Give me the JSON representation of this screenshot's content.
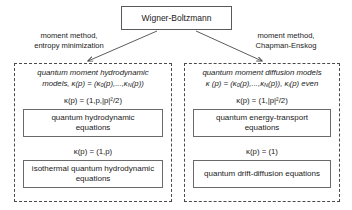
{
  "root": {
    "label": "Wigner-Boltzmann"
  },
  "branches": {
    "left": {
      "label_line1": "moment method,",
      "label_line2": "entropy minimization"
    },
    "right": {
      "label_line1": "moment method,",
      "label_line2": "Chapman-Enskog"
    }
  },
  "groups": [
    {
      "id": "quantum-moment-hydrodynamic-models",
      "header_line1": "quantum moment hydrodynamic",
      "header_line2": "models, κ(p) = (κ₀(p),...,κₙ(p))",
      "header_line2_parts": {
        "prefix": "models, κ(p) = (κ",
        "sub1": "0",
        "middle": "(p),...,κ",
        "sub2": "N",
        "suffix": "(p))"
      },
      "conditions": [
        "κ(p) = (1,p,|p|²/2)",
        "κ(p) = (1,p)"
      ],
      "models": [
        {
          "line1": "quantum hydrodynamic",
          "line2": "equations"
        },
        {
          "line1": "isothermal quantum hydrodynamic",
          "line2": "equations"
        }
      ]
    },
    {
      "id": "quantum-moment-diffusion-models",
      "header_line1": "quantum moment diffusion models",
      "header_line2": "κ (p) = (κ₀(p),...,κₙ(p)), κᵢ(p) even",
      "header_line2_parts": {
        "prefix": "κ (p) = (κ",
        "sub1": "0",
        "middle": "(p),...,κ",
        "sub2": "N",
        "suffix": "(p)), κ",
        "sub3": "i",
        "tail": "(p) even"
      },
      "conditions": [
        "κ(p) = (1,|p|²/2)",
        "κ(p) = (1)"
      ],
      "models": [
        {
          "line1": "quantum energy-transport",
          "line2": "equations"
        },
        {
          "line1": "quantum drift-diffusion equations",
          "line2": ""
        }
      ]
    }
  ],
  "colors": {
    "stroke": "#5a5a5a",
    "dashed_stroke": "#4a4a4a",
    "text": "#1a1a1a",
    "background": "#ffffff"
  }
}
